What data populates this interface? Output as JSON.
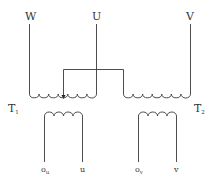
{
  "diagram": {
    "type": "transformer-connection-schematic",
    "terminals": {
      "W": {
        "label": "W"
      },
      "U": {
        "label": "U"
      },
      "V": {
        "label": "V"
      }
    },
    "transformers": [
      {
        "id": "T1",
        "label": "T",
        "subscript": "1",
        "primary_turns": 7,
        "secondary_turns": 4,
        "secondary_terminals": [
          {
            "label": "o",
            "subscript": "u"
          },
          {
            "label": "u",
            "subscript": ""
          }
        ]
      },
      {
        "id": "T2",
        "label": "T",
        "subscript": "2",
        "primary_turns": 7,
        "secondary_turns": 4,
        "secondary_terminals": [
          {
            "label": "o",
            "subscript": "v"
          },
          {
            "label": "v",
            "subscript": ""
          }
        ]
      }
    ],
    "connections": [
      "W to T1 primary left end",
      "U to T1 primary right end",
      "V to T2 primary right end",
      "T2 primary left end bridged to T1 primary center tap (arrow)"
    ],
    "colors": {
      "line": "#3a3a3a",
      "text": "#333333",
      "background": "#ffffff"
    }
  }
}
